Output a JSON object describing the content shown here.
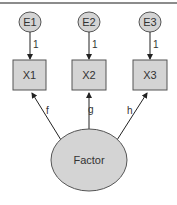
{
  "diagram": {
    "type": "confirmatory factor analysis path diagram",
    "error_terms": [
      {
        "id": "E1",
        "label": "E1",
        "loading_label": "1"
      },
      {
        "id": "E2",
        "label": "E2",
        "loading_label": "1"
      },
      {
        "id": "E3",
        "label": "E3",
        "loading_label": "1"
      }
    ],
    "observed": [
      {
        "id": "X1",
        "label": "X1",
        "path_label": "f"
      },
      {
        "id": "X2",
        "label": "X2",
        "path_label": "g"
      },
      {
        "id": "X3",
        "label": "X3",
        "path_label": "h"
      }
    ],
    "latent": {
      "id": "Factor",
      "label": "Factor"
    },
    "colors": {
      "fill": "#d4d4d4",
      "stroke": "#555555",
      "border": "#666666"
    }
  }
}
